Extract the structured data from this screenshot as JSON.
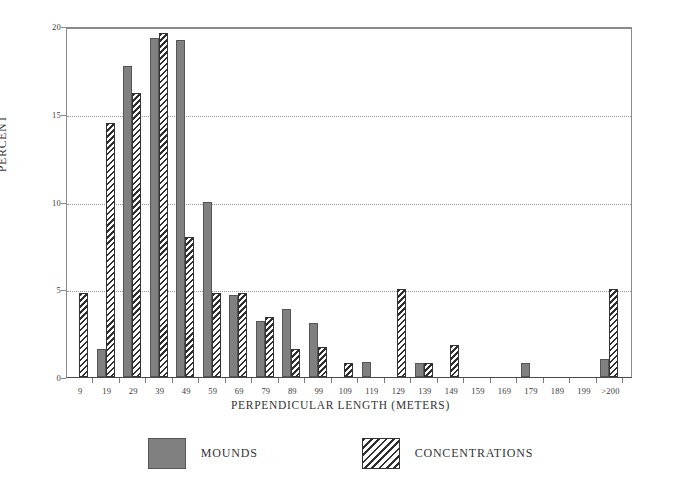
{
  "chart_data": {
    "type": "bar",
    "title": "",
    "xlabel": "PERPENDICULAR LENGTH (METERS)",
    "ylabel": "PERCENT",
    "ylim": [
      0,
      20
    ],
    "yticks": [
      0,
      5,
      10,
      15,
      20
    ],
    "ytick_labels": [
      "0",
      "5",
      "10",
      "15",
      "20"
    ],
    "grid": "horizontal dotted gridlines at 5, 10, 15, 20",
    "legend_position": "bottom-center",
    "categories": [
      "9",
      "19",
      "29",
      "39",
      "49",
      "59",
      "69",
      "79",
      "89",
      "99",
      "109",
      "119",
      "129",
      "139",
      "149",
      "159",
      "169",
      "179",
      "189",
      "199",
      ">200"
    ],
    "series": [
      {
        "name": "MOUNDS",
        "style": "solid-gray",
        "color": "#808080",
        "values": [
          0,
          1.6,
          17.7,
          19.3,
          19.2,
          10.0,
          4.7,
          3.2,
          3.9,
          3.1,
          0,
          0.85,
          0,
          0.8,
          0,
          0,
          0,
          0.8,
          0,
          0,
          1.0
        ]
      },
      {
        "name": "CONCENTRATIONS",
        "style": "diagonal-hatch",
        "color": "#2e2e2e",
        "values": [
          4.8,
          14.5,
          16.2,
          19.6,
          8.0,
          4.8,
          4.8,
          3.4,
          1.6,
          1.7,
          0.8,
          0,
          5.0,
          0.8,
          1.8,
          0,
          0,
          0,
          0,
          0,
          5.0
        ]
      }
    ]
  },
  "axes": {
    "y_title": "PERCENT",
    "x_title": "PERPENDICULAR LENGTH (METERS)"
  },
  "legend": {
    "entries": [
      {
        "label": "MOUNDS",
        "swatch": "solid-gray-swatch"
      },
      {
        "label": "CONCENTRATIONS",
        "swatch": "hatched-swatch"
      }
    ]
  }
}
